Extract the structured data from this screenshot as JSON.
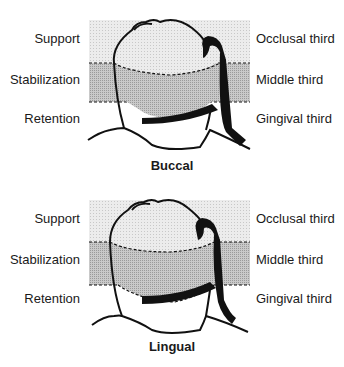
{
  "figures": [
    {
      "caption": "Buccal",
      "left_labels": [
        "Support",
        "Stabilization",
        "Retention"
      ],
      "right_labels": [
        "Occlusal third",
        "Middle third",
        "Gingival third"
      ]
    },
    {
      "caption": "Lingual",
      "left_labels": [
        "Support",
        "Stabilization",
        "Retention"
      ],
      "right_labels": [
        "Occlusal third",
        "Middle third",
        "Gingival third"
      ]
    }
  ],
  "colors": {
    "occlusal_band": "#e6e6e6",
    "middle_band": "#bdbdbd",
    "outline": "#111111"
  }
}
